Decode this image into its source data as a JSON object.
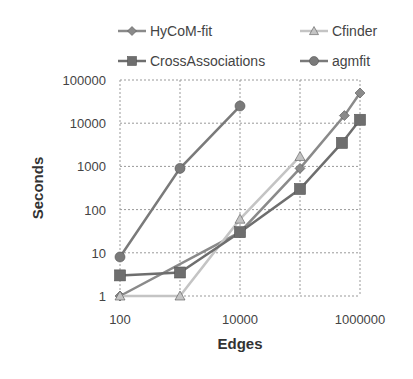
{
  "chart_data": {
    "type": "line",
    "title": "",
    "xlabel": "Edges",
    "ylabel": "Seconds",
    "xscale": "log",
    "yscale": "log",
    "xlim": [
      100,
      1000000
    ],
    "ylim": [
      1,
      100000
    ],
    "x_ticks": [
      "100",
      "10000",
      "1000000"
    ],
    "y_ticks": [
      "1",
      "10",
      "100",
      "1000",
      "10000",
      "100000"
    ],
    "grid": true,
    "legend_position": "top",
    "series": [
      {
        "name": "HyCoM-fit",
        "color": "#8a8a8a",
        "marker": "diamond",
        "points": [
          [
            100,
            1
          ],
          [
            10000,
            30
          ],
          [
            100000,
            900
          ],
          [
            550000,
            15000
          ],
          [
            1000000,
            50000
          ]
        ]
      },
      {
        "name": "Cfinder",
        "color": "#c4c4c4",
        "marker": "triangle",
        "points": [
          [
            100,
            1
          ],
          [
            1000,
            1
          ],
          [
            10000,
            60
          ],
          [
            100000,
            1700
          ]
        ]
      },
      {
        "name": "CrossAssociations",
        "color": "#6e6e6e",
        "marker": "square",
        "points": [
          [
            100,
            3
          ],
          [
            1000,
            3.5
          ],
          [
            10000,
            30
          ],
          [
            100000,
            300
          ],
          [
            500000,
            3500
          ],
          [
            1000000,
            12000
          ]
        ]
      },
      {
        "name": "agmfit",
        "color": "#7a7a7a",
        "marker": "circle",
        "points": [
          [
            100,
            8
          ],
          [
            1000,
            900
          ],
          [
            10000,
            25000
          ]
        ]
      }
    ]
  },
  "legend": [
    {
      "label": "HyCoM-fit"
    },
    {
      "label": "Cfinder"
    },
    {
      "label": "CrossAssociations"
    },
    {
      "label": "agmfit"
    }
  ]
}
